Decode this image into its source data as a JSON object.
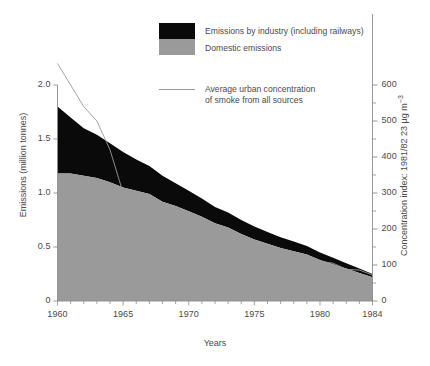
{
  "axes": {
    "x": {
      "title": "Years",
      "min": 1960,
      "max": 1984,
      "ticks": [
        1960,
        1965,
        1970,
        1975,
        1980,
        1984
      ],
      "minor_step": 1
    },
    "y_left": {
      "title": "Emissions (million tonnes)",
      "min": 0,
      "max": 2.0,
      "ticks": [
        "0",
        "0.5",
        "1.0",
        "1.5",
        "2.0"
      ],
      "tick_values": [
        0,
        0.5,
        1.0,
        1.5,
        2.0
      ]
    },
    "y_right": {
      "title": "Concentration index: 1981/82 23 µg m",
      "title_sup": "−3",
      "min": 0,
      "max": 600,
      "ticks": [
        "0",
        "100",
        "200",
        "300",
        "400",
        "500",
        "600"
      ],
      "tick_values": [
        0,
        100,
        200,
        300,
        400,
        500,
        600
      ],
      "minor_step": 50
    }
  },
  "legend": {
    "items": [
      {
        "label": "Emissions by industry (including railways)",
        "marker": "black-swatch",
        "color": "#0a0a0a"
      },
      {
        "label": "Domestic emissions",
        "marker": "gray-swatch",
        "color": "#9a9a9a"
      },
      {
        "label": "Average urban concentration\nof smoke from all sources",
        "label_line1": "Average urban concentration",
        "label_line2": "of smoke from all sources",
        "marker": "line-sample",
        "color": "#8e8e8e"
      }
    ]
  },
  "colors": {
    "industry": "#0a0a0a",
    "domestic": "#9a9a9a",
    "line": "#9a9a9a",
    "axis": "#8c8c8c",
    "text": "#4a4a4a",
    "background": "#ffffff"
  },
  "chart_data": {
    "type": "area",
    "title": "",
    "xlabel": "Years",
    "ylabel": "Emissions (million tonnes)",
    "y2label": "Concentration index: 1981/82 23 µg m−3",
    "xlim": [
      1960,
      1984
    ],
    "ylim": [
      0,
      2.0
    ],
    "y2lim": [
      0,
      600
    ],
    "grid": false,
    "legend_position": "top-center",
    "stacked": true,
    "x": [
      1960,
      1961,
      1962,
      1963,
      1964,
      1965,
      1966,
      1967,
      1968,
      1969,
      1970,
      1971,
      1972,
      1973,
      1974,
      1975,
      1976,
      1977,
      1978,
      1979,
      1980,
      1981,
      1982,
      1983,
      1984
    ],
    "series": [
      {
        "name": "Domestic emissions",
        "axis": "left",
        "units": "million tonnes",
        "values": [
          1.18,
          1.18,
          1.16,
          1.14,
          1.1,
          1.05,
          1.02,
          0.99,
          0.92,
          0.88,
          0.83,
          0.78,
          0.72,
          0.68,
          0.62,
          0.57,
          0.53,
          0.49,
          0.46,
          0.43,
          0.38,
          0.34,
          0.3,
          0.26,
          0.22
        ]
      },
      {
        "name": "Emissions by industry (including railways)",
        "axis": "left",
        "units": "million tonnes",
        "values": [
          0.62,
          0.52,
          0.44,
          0.4,
          0.36,
          0.33,
          0.29,
          0.26,
          0.24,
          0.21,
          0.19,
          0.17,
          0.15,
          0.14,
          0.13,
          0.12,
          0.11,
          0.1,
          0.09,
          0.08,
          0.07,
          0.06,
          0.05,
          0.04,
          0.03
        ]
      },
      {
        "name": "Average urban concentration of smoke from all sources",
        "axis": "right",
        "type": "line",
        "units": "index",
        "values": [
          660,
          600,
          540,
          500,
          420,
          300,
          290,
          265,
          245,
          225,
          205,
          165,
          150,
          145,
          125,
          105,
          100,
          98,
          95,
          92,
          110,
          105,
          88,
          86,
          72
        ]
      }
    ],
    "totals_left": [
      1.8,
      1.7,
      1.6,
      1.54,
      1.46,
      1.38,
      1.31,
      1.25,
      1.16,
      1.09,
      1.02,
      0.95,
      0.87,
      0.82,
      0.75,
      0.69,
      0.64,
      0.59,
      0.55,
      0.51,
      0.45,
      0.4,
      0.35,
      0.3,
      0.25
    ]
  }
}
